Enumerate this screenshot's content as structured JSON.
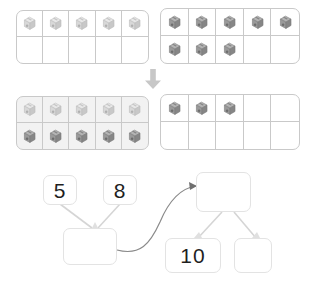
{
  "worksheet": {
    "title": "Make a ten  5 + 8 number bond",
    "topic": "addition-make-ten"
  },
  "ten_frames": {
    "capacity": 10,
    "columns": 5,
    "rows": 2,
    "frames": [
      {
        "id": "row1-left",
        "name": "first-addend-frame",
        "addend": 5,
        "filled_count": 5,
        "cube_shade": "light",
        "background": "white",
        "cells": [
          "light",
          "light",
          "light",
          "light",
          "light",
          "empty",
          "empty",
          "empty",
          "empty",
          "empty"
        ]
      },
      {
        "id": "row1-right",
        "name": "second-addend-frame",
        "addend": 8,
        "filled_count": 8,
        "cube_shade": "dark",
        "background": "white",
        "cells": [
          "dark",
          "dark",
          "dark",
          "dark",
          "dark",
          "dark",
          "dark",
          "dark",
          "empty",
          "empty"
        ]
      },
      {
        "id": "row2-left",
        "name": "completed-ten-frame",
        "addend": 10,
        "filled_count": 10,
        "cube_shade": "mixed",
        "background": "shaded",
        "cells": [
          "light",
          "light",
          "light",
          "light",
          "light",
          "dark",
          "dark",
          "dark",
          "dark",
          "dark"
        ]
      },
      {
        "id": "row2-right",
        "name": "leftover-frame",
        "addend": 3,
        "filled_count": 3,
        "cube_shade": "dark",
        "background": "white",
        "cells": [
          "dark",
          "dark",
          "dark",
          "empty",
          "empty",
          "empty",
          "empty",
          "empty",
          "empty",
          "empty"
        ]
      }
    ]
  },
  "transition": {
    "icon": "down-arrow-icon",
    "color": "#c4c4c4"
  },
  "number_bond": {
    "left_bond": {
      "parents": [
        {
          "name": "addend-5",
          "value": "5",
          "filled": true
        },
        {
          "name": "addend-8",
          "value": "8",
          "filled": true
        }
      ],
      "child": {
        "name": "sum-answer",
        "value": "",
        "filled": false
      }
    },
    "transfer_arrow": {
      "icon": "curved-arrow-icon",
      "color": "#8a8a8a"
    },
    "right_bond": {
      "parent": {
        "name": "total-answer",
        "value": "",
        "filled": false
      },
      "children": [
        {
          "name": "part-ten",
          "value": "10",
          "filled": true
        },
        {
          "name": "part-remainder",
          "value": "",
          "filled": false
        }
      ]
    }
  },
  "colors": {
    "frame_border": "#c9c9c9",
    "box_border": "#e3e3e3",
    "shaded_fill": "#f2f2f2",
    "cube_light": "#d8d8d8",
    "cube_dark": "#9a9a9a",
    "text": "#1f1f1f",
    "connector": "#cfcfcf"
  }
}
